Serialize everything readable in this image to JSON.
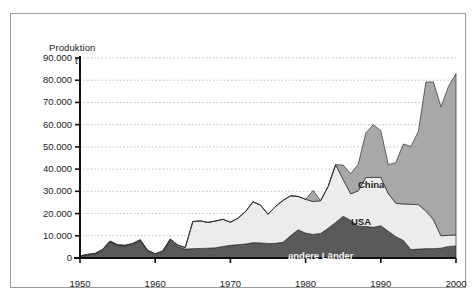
{
  "figure": {
    "axis_title": "Produktion",
    "axis_unit": "t"
  },
  "chart_data": {
    "type": "area",
    "stacked": true,
    "title": "Produktion",
    "xlabel": "",
    "ylabel": "Produktion t",
    "ylim": [
      0,
      90000
    ],
    "xlim": [
      1950,
      2000
    ],
    "grid": true,
    "legend_position": "inline-labels",
    "ytick_labels": [
      "0",
      "10.000",
      "20.000",
      "30.000",
      "40.000",
      "50.000",
      "60.000",
      "70.000",
      "80.000",
      "90.000"
    ],
    "ytick_values": [
      0,
      10000,
      20000,
      30000,
      40000,
      50000,
      60000,
      70000,
      80000,
      90000
    ],
    "xtick_labels": [
      "1950",
      "1960",
      "1970",
      "1980",
      "1990",
      "2000"
    ],
    "xtick_values": [
      1950,
      1960,
      1970,
      1980,
      1990,
      2000
    ],
    "x": [
      1950,
      1951,
      1952,
      1953,
      1954,
      1955,
      1956,
      1957,
      1958,
      1959,
      1960,
      1961,
      1962,
      1963,
      1964,
      1965,
      1966,
      1967,
      1968,
      1969,
      1970,
      1971,
      1972,
      1973,
      1974,
      1975,
      1976,
      1977,
      1978,
      1979,
      1980,
      1981,
      1982,
      1983,
      1984,
      1985,
      1986,
      1987,
      1988,
      1989,
      1990,
      1991,
      1992,
      1993,
      1994,
      1995,
      1996,
      1997,
      1998,
      1999,
      2000
    ],
    "series": [
      {
        "name": "andere Länder",
        "color": "#5a5a5a",
        "values": [
          800,
          1400,
          1800,
          3500,
          7300,
          5600,
          5400,
          6100,
          7800,
          3000,
          1500,
          2600,
          8000,
          5200,
          4000,
          4200,
          4300,
          4400,
          4600,
          5200,
          5700,
          6000,
          6300,
          6900,
          6800,
          6500,
          6600,
          7100,
          10000,
          12700,
          11200,
          10600,
          11000,
          13400,
          16000,
          18800,
          16900,
          14400,
          14200,
          13800,
          14500,
          12000,
          9600,
          7900,
          3800,
          4000,
          4200,
          4200,
          4400,
          5200,
          5400
        ]
      },
      {
        "name": "USA",
        "color": "#ececec",
        "values": [
          100,
          200,
          200,
          300,
          300,
          300,
          300,
          400,
          400,
          400,
          400,
          500,
          500,
          600,
          700,
          12200,
          12400,
          11600,
          12000,
          12200,
          10400,
          11900,
          14500,
          18400,
          17000,
          13200,
          16600,
          18800,
          18000,
          15000,
          15200,
          14800,
          14800,
          18800,
          26000,
          16500,
          12000,
          15800,
          22000,
          22500,
          21800,
          17000,
          15000,
          16400,
          20400,
          20000,
          17000,
          13000,
          5600,
          5000,
          5000
        ]
      },
      {
        "name": "China",
        "color": "#a8a8a8",
        "values": [
          0,
          0,
          0,
          0,
          0,
          0,
          0,
          0,
          0,
          0,
          0,
          0,
          0,
          0,
          0,
          0,
          0,
          0,
          0,
          0,
          0,
          0,
          0,
          0,
          0,
          0,
          0,
          0,
          0,
          0,
          0,
          5000,
          0,
          0,
          0,
          6500,
          9000,
          12000,
          20000,
          23700,
          21000,
          13000,
          18300,
          27000,
          26000,
          33000,
          58000,
          62000,
          58000,
          67000,
          72600
        ]
      }
    ],
    "series_labels": [
      {
        "name": "China",
        "text": "China"
      },
      {
        "name": "USA",
        "text": "USA"
      },
      {
        "name": "andere Länder",
        "text": "andere Länder"
      }
    ],
    "totals": [
      900,
      1600,
      2000,
      3800,
      7600,
      5900,
      5700,
      6500,
      8200,
      3400,
      1900,
      3100,
      8500,
      5800,
      4700,
      16400,
      16700,
      16000,
      16600,
      17400,
      16100,
      17900,
      20800,
      25300,
      23800,
      19700,
      23200,
      25900,
      28000,
      27700,
      26400,
      30400,
      25800,
      32200,
      42000,
      41800,
      37900,
      42200,
      56200,
      60000,
      57300,
      42000,
      42900,
      51300,
      50200,
      57000,
      79200,
      79200,
      68000,
      77200,
      83000
    ]
  }
}
